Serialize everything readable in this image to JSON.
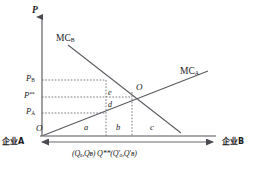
{
  "figure": {
    "type": "economics-diagram",
    "axes": {
      "vertical_label": "P",
      "origin_label": "O",
      "left_endpoint_label": "企业A",
      "right_endpoint_label": "企业B"
    },
    "curves": [
      {
        "name": "MC-B",
        "label_base": "MC",
        "label_sub": "B",
        "slope": "downward"
      },
      {
        "name": "MC-A",
        "label_base": "MC",
        "label_sub": "A",
        "slope": "upward"
      }
    ],
    "price_ticks": [
      {
        "id": "p-b",
        "base": "P",
        "sub": "B",
        "sup": ""
      },
      {
        "id": "p-double",
        "base": "P",
        "sub": "",
        "sup": "**"
      },
      {
        "id": "p-a",
        "base": "P",
        "sub": "A",
        "sup": ""
      }
    ],
    "point_labels": [
      {
        "id": "point-o",
        "text": "O"
      },
      {
        "id": "point-e",
        "text": "e"
      },
      {
        "id": "point-d",
        "text": "d"
      }
    ],
    "regions": [
      {
        "id": "region-a",
        "text": "a"
      },
      {
        "id": "region-b",
        "text": "b"
      },
      {
        "id": "region-c",
        "text": "c"
      }
    ],
    "bottom_axis_annotation": {
      "left_quantity": "(Qₐ,Qʙ)",
      "equilibrium": "Q**",
      "right_quantity": "(Q′ₐ,Q′ʙ)"
    },
    "colors": {
      "ink": "#1a1a1a",
      "line": "#55555a",
      "dotted": "#6a6a70",
      "background": "#ffffff"
    }
  }
}
